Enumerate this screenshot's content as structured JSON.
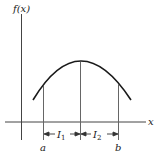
{
  "figure": {
    "type": "function-sketch",
    "y_axis_label": "f(x)",
    "x_axis_label": "x",
    "points": {
      "a": "a",
      "b": "b"
    },
    "intervals": [
      {
        "symbol": "I",
        "subscript": "1"
      },
      {
        "symbol": "I",
        "subscript": "2"
      }
    ],
    "curve": "concave-down arc with maximum between a and b",
    "colors": {
      "ink": "#1a1a1a",
      "thin_lines": "#555555",
      "background": "#ffffff"
    }
  }
}
